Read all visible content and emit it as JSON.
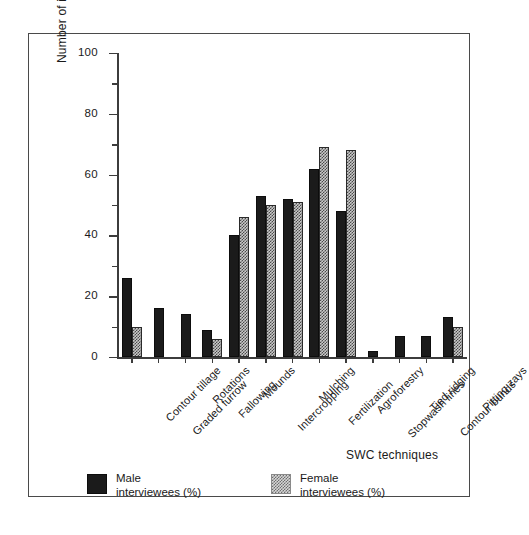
{
  "figure": {
    "y_axis_title": "Number of interviewees (%) by gender",
    "x_axis_title": "SWC techniques",
    "legend": {
      "male": "Male\ninterviewees (%)",
      "female": "Female\ninterviewees (%)"
    },
    "colors": {
      "male_bar": "#1b1b1b",
      "female_bar": "#c9c9c9",
      "axis": "#3c3c3c",
      "frame": "#4a4a4a"
    }
  },
  "chart_data": {
    "type": "bar",
    "title": "",
    "xlabel": "SWC techniques",
    "ylabel": "Number of interviewees (%) by gender",
    "ylim": [
      0,
      100
    ],
    "ytick_labels": [
      "0",
      "20",
      "40",
      "60",
      "80",
      "100"
    ],
    "ytick_values": [
      0,
      20,
      40,
      60,
      80,
      100
    ],
    "yminor_ticks": [
      10,
      30,
      50,
      70,
      90
    ],
    "grid": false,
    "legend_position": "bottom-left",
    "categories": [
      "Contour tillage",
      "Graded furrow",
      "Rotations",
      "Fallowing",
      "Mounds",
      "Intercropping",
      "Mulching",
      "Fertilization",
      "Agroforestry",
      "Stopwash lines",
      "Tied ridging",
      "Contour bunds",
      "Pitting zays"
    ],
    "series": [
      {
        "name": "Male interviewees (%)",
        "values": [
          26,
          16,
          14,
          9,
          40,
          53,
          52,
          62,
          48,
          2,
          7,
          7,
          13
        ]
      },
      {
        "name": "Female interviewees (%)",
        "values": [
          10,
          0,
          0,
          6,
          46,
          50,
          51,
          69,
          68,
          0,
          0,
          0,
          10
        ]
      }
    ]
  }
}
